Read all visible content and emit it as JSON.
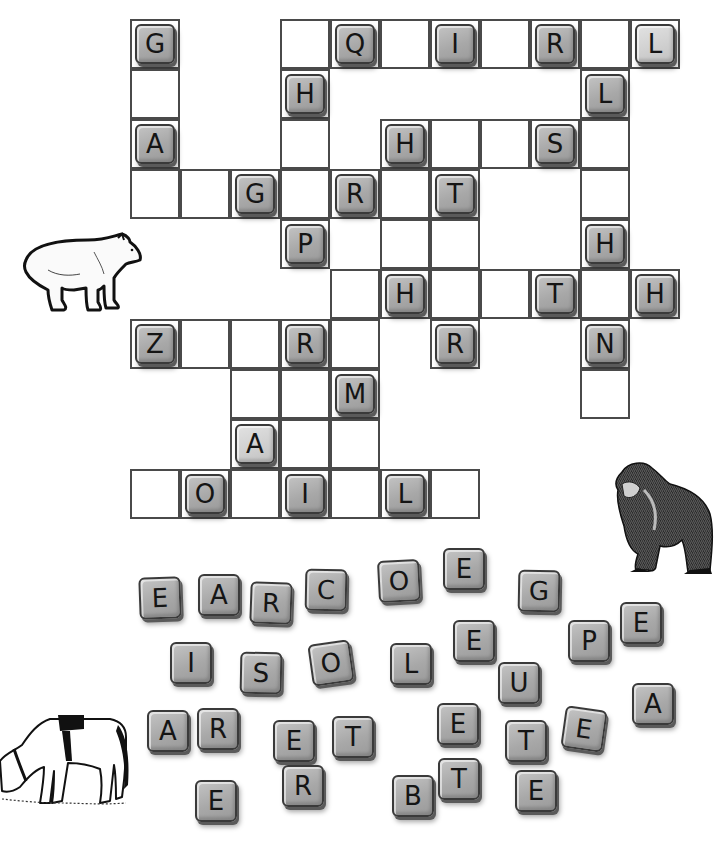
{
  "puzzle": {
    "type": "crossword-fill-in",
    "grid_origin": [
      130,
      19
    ],
    "cell_size": 50,
    "cells": [
      {
        "r": 0,
        "c": 0,
        "letter": "G"
      },
      {
        "r": 0,
        "c": 3,
        "letter": ""
      },
      {
        "r": 0,
        "c": 4,
        "letter": "Q"
      },
      {
        "r": 0,
        "c": 5,
        "letter": ""
      },
      {
        "r": 0,
        "c": 6,
        "letter": "I"
      },
      {
        "r": 0,
        "c": 7,
        "letter": ""
      },
      {
        "r": 0,
        "c": 8,
        "letter": "R"
      },
      {
        "r": 0,
        "c": 9,
        "letter": ""
      },
      {
        "r": 0,
        "c": 10,
        "letter": "L",
        "light": true
      },
      {
        "r": 1,
        "c": 0,
        "letter": ""
      },
      {
        "r": 1,
        "c": 3,
        "letter": "H"
      },
      {
        "r": 1,
        "c": 9,
        "letter": "L"
      },
      {
        "r": 2,
        "c": 0,
        "letter": "A"
      },
      {
        "r": 2,
        "c": 3,
        "letter": ""
      },
      {
        "r": 2,
        "c": 5,
        "letter": "H"
      },
      {
        "r": 2,
        "c": 6,
        "letter": ""
      },
      {
        "r": 2,
        "c": 7,
        "letter": ""
      },
      {
        "r": 2,
        "c": 8,
        "letter": "S"
      },
      {
        "r": 2,
        "c": 9,
        "letter": ""
      },
      {
        "r": 3,
        "c": 0,
        "letter": ""
      },
      {
        "r": 3,
        "c": 1,
        "letter": ""
      },
      {
        "r": 3,
        "c": 2,
        "letter": "G"
      },
      {
        "r": 3,
        "c": 3,
        "letter": ""
      },
      {
        "r": 3,
        "c": 4,
        "letter": "R"
      },
      {
        "r": 3,
        "c": 5,
        "letter": ""
      },
      {
        "r": 3,
        "c": 6,
        "letter": "T"
      },
      {
        "r": 3,
        "c": 9,
        "letter": ""
      },
      {
        "r": 4,
        "c": 3,
        "letter": "P"
      },
      {
        "r": 4,
        "c": 5,
        "letter": ""
      },
      {
        "r": 4,
        "c": 6,
        "letter": ""
      },
      {
        "r": 4,
        "c": 9,
        "letter": "H"
      },
      {
        "r": 5,
        "c": 4,
        "letter": ""
      },
      {
        "r": 5,
        "c": 5,
        "letter": "H"
      },
      {
        "r": 5,
        "c": 6,
        "letter": ""
      },
      {
        "r": 5,
        "c": 7,
        "letter": ""
      },
      {
        "r": 5,
        "c": 8,
        "letter": "T"
      },
      {
        "r": 5,
        "c": 9,
        "letter": ""
      },
      {
        "r": 5,
        "c": 10,
        "letter": "H"
      },
      {
        "r": 6,
        "c": 0,
        "letter": "Z"
      },
      {
        "r": 6,
        "c": 1,
        "letter": ""
      },
      {
        "r": 6,
        "c": 2,
        "letter": ""
      },
      {
        "r": 6,
        "c": 3,
        "letter": "R"
      },
      {
        "r": 6,
        "c": 4,
        "letter": ""
      },
      {
        "r": 6,
        "c": 6,
        "letter": "R"
      },
      {
        "r": 6,
        "c": 9,
        "letter": "N"
      },
      {
        "r": 7,
        "c": 2,
        "letter": ""
      },
      {
        "r": 7,
        "c": 3,
        "letter": ""
      },
      {
        "r": 7,
        "c": 4,
        "letter": "M"
      },
      {
        "r": 7,
        "c": 9,
        "letter": ""
      },
      {
        "r": 8,
        "c": 2,
        "letter": "A",
        "light": true
      },
      {
        "r": 8,
        "c": 3,
        "letter": ""
      },
      {
        "r": 8,
        "c": 4,
        "letter": ""
      },
      {
        "r": 9,
        "c": 0,
        "letter": ""
      },
      {
        "r": 9,
        "c": 1,
        "letter": "O"
      },
      {
        "r": 9,
        "c": 2,
        "letter": ""
      },
      {
        "r": 9,
        "c": 3,
        "letter": "I"
      },
      {
        "r": 9,
        "c": 4,
        "letter": ""
      },
      {
        "r": 9,
        "c": 5,
        "letter": "L"
      },
      {
        "r": 9,
        "c": 6,
        "letter": ""
      }
    ]
  },
  "letter_bank": [
    {
      "letter": "E",
      "x": 139,
      "y": 577,
      "rot": -2
    },
    {
      "letter": "A",
      "x": 198,
      "y": 574,
      "rot": 0
    },
    {
      "letter": "R",
      "x": 250,
      "y": 582,
      "rot": 2
    },
    {
      "letter": "C",
      "x": 305,
      "y": 569,
      "rot": 1
    },
    {
      "letter": "O",
      "x": 378,
      "y": 560,
      "rot": -3
    },
    {
      "letter": "E",
      "x": 443,
      "y": 548,
      "rot": 0
    },
    {
      "letter": "G",
      "x": 518,
      "y": 570,
      "rot": 1
    },
    {
      "letter": "I",
      "x": 170,
      "y": 642,
      "rot": 0
    },
    {
      "letter": "S",
      "x": 240,
      "y": 652,
      "rot": 1
    },
    {
      "letter": "O",
      "x": 310,
      "y": 642,
      "rot": -8
    },
    {
      "letter": "L",
      "x": 390,
      "y": 643,
      "rot": 0
    },
    {
      "letter": "E",
      "x": 453,
      "y": 620,
      "rot": 0
    },
    {
      "letter": "U",
      "x": 498,
      "y": 662,
      "rot": 0
    },
    {
      "letter": "P",
      "x": 568,
      "y": 620,
      "rot": 0
    },
    {
      "letter": "E",
      "x": 620,
      "y": 602,
      "rot": 0
    },
    {
      "letter": "A",
      "x": 147,
      "y": 710,
      "rot": 0
    },
    {
      "letter": "R",
      "x": 197,
      "y": 708,
      "rot": 0
    },
    {
      "letter": "E",
      "x": 273,
      "y": 720,
      "rot": 0
    },
    {
      "letter": "T",
      "x": 332,
      "y": 716,
      "rot": 0
    },
    {
      "letter": "E",
      "x": 437,
      "y": 703,
      "rot": 0
    },
    {
      "letter": "T",
      "x": 505,
      "y": 720,
      "rot": 0
    },
    {
      "letter": "E",
      "x": 563,
      "y": 708,
      "rot": 8
    },
    {
      "letter": "A",
      "x": 632,
      "y": 683,
      "rot": 0
    },
    {
      "letter": "E",
      "x": 195,
      "y": 780,
      "rot": 0
    },
    {
      "letter": "R",
      "x": 282,
      "y": 765,
      "rot": 0
    },
    {
      "letter": "B",
      "x": 392,
      "y": 775,
      "rot": 0
    },
    {
      "letter": "T",
      "x": 438,
      "y": 758,
      "rot": 0
    },
    {
      "letter": "E",
      "x": 515,
      "y": 770,
      "rot": 0
    }
  ],
  "illustrations": {
    "polar_bear": "polar-bear-icon",
    "gorilla": "gorilla-icon",
    "horse": "horse-icon"
  },
  "colors": {
    "tile": "#a8a8a8",
    "tile_light": "#d0d0d0",
    "grid_line": "#4a4a4a",
    "background": "#ffffff"
  }
}
